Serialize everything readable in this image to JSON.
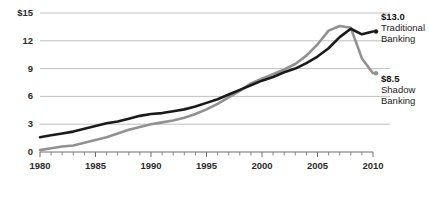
{
  "chart_data": {
    "type": "line",
    "title": "",
    "subtitle": "",
    "xlabel": "",
    "ylabel": "",
    "xlim": [
      1980,
      2010
    ],
    "ylim": [
      0,
      15
    ],
    "grid": true,
    "grid_axis": "y",
    "legend_position": "right-inline-annotation",
    "x_tick_labels": [
      "1980",
      "1985",
      "1990",
      "1995",
      "2000",
      "2005",
      "2010"
    ],
    "x_ticks": [
      1980,
      1985,
      1990,
      1995,
      2000,
      2005,
      2010
    ],
    "x_minor_tick_interval": 1,
    "y_tick_labels": [
      "$15",
      "12",
      "9",
      "6",
      "3",
      "0"
    ],
    "y_ticks": [
      15,
      12,
      9,
      6,
      3,
      0
    ],
    "x": [
      1980,
      1981,
      1982,
      1983,
      1984,
      1985,
      1986,
      1987,
      1988,
      1989,
      1990,
      1991,
      1992,
      1993,
      1994,
      1995,
      1996,
      1997,
      1998,
      1999,
      2000,
      2001,
      2002,
      2003,
      2004,
      2005,
      2006,
      2007,
      2008,
      2009,
      2010
    ],
    "series": [
      {
        "name": "Traditional Banking",
        "color": "#1a1a1a",
        "end_value": 13.0,
        "end_label": "$13.0",
        "values": [
          1.6,
          1.8,
          2.0,
          2.2,
          2.5,
          2.8,
          3.1,
          3.3,
          3.6,
          3.9,
          4.1,
          4.2,
          4.4,
          4.6,
          4.9,
          5.3,
          5.7,
          6.2,
          6.7,
          7.2,
          7.7,
          8.1,
          8.6,
          9.0,
          9.6,
          10.3,
          11.2,
          12.4,
          13.3,
          12.7,
          13.0
        ]
      },
      {
        "name": "Shadow Banking",
        "color": "#919191",
        "end_value": 8.5,
        "end_label": "$8.5",
        "values": [
          0.2,
          0.4,
          0.6,
          0.7,
          1.0,
          1.3,
          1.6,
          2.0,
          2.4,
          2.7,
          3.0,
          3.2,
          3.4,
          3.7,
          4.1,
          4.6,
          5.2,
          5.9,
          6.6,
          7.4,
          7.9,
          8.4,
          8.9,
          9.5,
          10.4,
          11.6,
          13.1,
          13.6,
          13.4,
          10.1,
          8.5
        ]
      }
    ],
    "annotations": [
      {
        "value": "$13.0",
        "name_line1": "Traditional",
        "name_line2": "Banking",
        "color": "#1a1a1a"
      },
      {
        "value": "$8.5",
        "name_line1": "Shadow",
        "name_line2": "Banking",
        "color": "#919191"
      }
    ],
    "colors": {
      "traditional_banking": "#1a1a1a",
      "shadow_banking": "#919191",
      "gridline": "#b9b9b9",
      "axis": "#6e6e6e",
      "text": "#2b2b2b",
      "background": "#ffffff"
    }
  }
}
